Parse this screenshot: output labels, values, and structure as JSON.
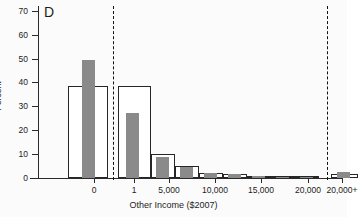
{
  "panel": {
    "label": "D"
  },
  "axes": {
    "y_title": "Percent",
    "x_title": "Other Income ($2007)",
    "y_ticks": [
      "0",
      "10",
      "20",
      "30",
      "40",
      "50",
      "60",
      "70"
    ],
    "x_ticks": [
      "0",
      "1",
      "5,000",
      "10,000",
      "15,000",
      "20,000",
      "20,000+"
    ]
  },
  "colors": {
    "solid_series": "#8a8a8a",
    "hollow_series_outline": "#262626",
    "axis": "#2a2a2a",
    "separator": "#111111",
    "background": "#fbfbfb"
  },
  "chart_data": {
    "type": "bar",
    "title": "D",
    "xlabel": "Other Income ($2007)",
    "ylabel": "Percent",
    "ylim": [
      0,
      72
    ],
    "xlim": [
      0,
      300
    ],
    "grid": false,
    "legend": null,
    "note": "Two overlaid histogram series: hollow outlined bars and gray filled bars. Vertical dashed lines separate the zero category and the top-coded 20,000+ category.",
    "x_tick_labels": [
      "0",
      "1",
      "5,000",
      "10,000",
      "15,000",
      "20,000",
      "20,000+"
    ],
    "x_tick_positions": [
      56,
      96,
      131,
      177,
      223,
      270,
      304
    ],
    "separators": [
      75,
      289
    ],
    "series": [
      {
        "name": "hollow",
        "style": "outlined-white",
        "bins": [
          {
            "label": "0",
            "x0": 30,
            "x1": 70,
            "value": 38.6
          },
          {
            "label": "1-2,500",
            "x0": 80,
            "x1": 113,
            "value": 38.6
          },
          {
            "label": "2,500-5,000",
            "x0": 113,
            "x1": 137,
            "value": 10.0
          },
          {
            "label": "5,000-7,500",
            "x0": 137,
            "x1": 161,
            "value": 4.9
          },
          {
            "label": "7,500-10,000",
            "x0": 161,
            "x1": 185,
            "value": 2.2
          },
          {
            "label": "10,000-12,500",
            "x0": 185,
            "x1": 209,
            "value": 1.7
          },
          {
            "label": "12,500-15,000",
            "x0": 209,
            "x1": 233,
            "value": 1.0
          },
          {
            "label": "15,000-17,500",
            "x0": 233,
            "x1": 257,
            "value": 0.9
          },
          {
            "label": "17,500-20,000",
            "x0": 257,
            "x1": 281,
            "value": 0.8
          },
          {
            "label": "20,000+",
            "x0": 293,
            "x1": 320,
            "value": 1.6
          }
        ]
      },
      {
        "name": "solid",
        "style": "filled-gray",
        "bins": [
          {
            "label": "0",
            "x0": 44,
            "x1": 57,
            "value": 49.3
          },
          {
            "label": "1-2,500",
            "x0": 88,
            "x1": 101,
            "value": 27.3
          },
          {
            "label": "2,500-5,000",
            "x0": 118,
            "x1": 131,
            "value": 8.7
          },
          {
            "label": "5,000-7,500",
            "x0": 142,
            "x1": 155,
            "value": 4.8
          },
          {
            "label": "7,500-10,000",
            "x0": 166,
            "x1": 179,
            "value": 2.1
          },
          {
            "label": "10,000-12,500",
            "x0": 190,
            "x1": 203,
            "value": 1.6
          },
          {
            "label": "12,500-15,000",
            "x0": 214,
            "x1": 227,
            "value": 0.7
          },
          {
            "label": "15,000-17,500",
            "x0": 238,
            "x1": 251,
            "value": 0.5
          },
          {
            "label": "17,500-20,000",
            "x0": 262,
            "x1": 275,
            "value": 0.5
          },
          {
            "label": "20,000+",
            "x0": 299,
            "x1": 312,
            "value": 2.6
          }
        ]
      }
    ]
  }
}
